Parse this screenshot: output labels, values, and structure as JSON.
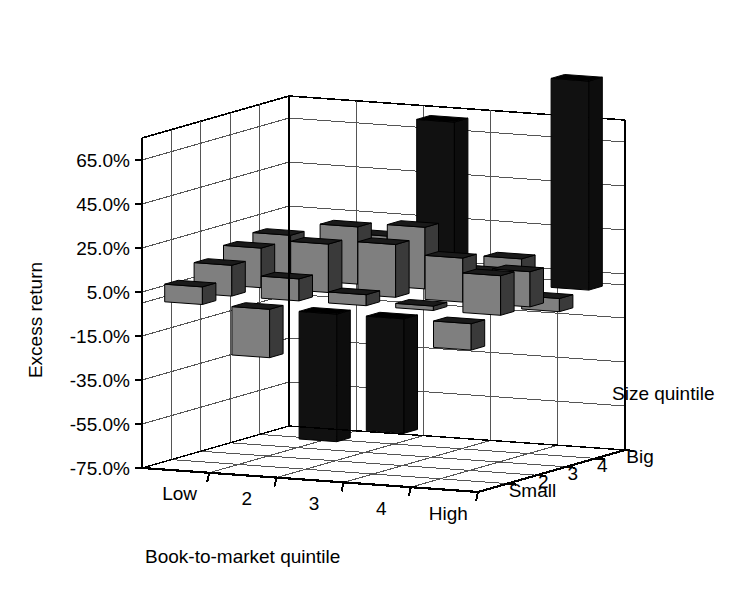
{
  "chart_data": {
    "type": "bar",
    "subtype": "3d-grouped-bar",
    "title": "",
    "xlabel": "Book-to-market quintile",
    "ylabel": "Excess return",
    "zlabel": "Size quintile",
    "categories": [
      "Low",
      "2",
      "3",
      "4",
      "High"
    ],
    "z_categories": [
      "Small",
      "2",
      "3",
      "4",
      "Big"
    ],
    "ylim": [
      -75,
      75
    ],
    "ytick_labels": [
      "65.0%",
      "45.0%",
      "25.0%",
      "5.0%",
      "-15.0%",
      "-35.0%",
      "-55.0%",
      "-75.0%"
    ],
    "ytick_values": [
      65,
      45,
      25,
      5,
      -15,
      -35,
      -55,
      -75
    ],
    "grid": true,
    "legend": "none",
    "units": "percent",
    "series": [
      {
        "name": "Small",
        "values": [
          8,
          -22,
          -58,
          -52,
          -12
        ]
      },
      {
        "name": "2",
        "values": [
          14,
          10,
          5,
          2,
          18
        ]
      },
      {
        "name": "3",
        "values": [
          18,
          22,
          24,
          20,
          16
        ]
      },
      {
        "name": "4",
        "values": [
          20,
          26,
          28,
          10,
          -6
        ]
      },
      {
        "name": "Big",
        "values": [
          10,
          18,
          72,
          12,
          95
        ]
      }
    ]
  },
  "axes": {
    "y_title": "Excess return",
    "x_title": "Book-to-market quintile",
    "z_title": "Size quintile",
    "y_ticks": [
      "65.0%",
      "45.0%",
      "25.0%",
      "5.0%",
      "-15.0%",
      "-35.0%",
      "-55.0%",
      "-75.0%"
    ],
    "x_ticks": [
      "Low",
      "2",
      "3",
      "4",
      "High"
    ],
    "z_ticks": [
      "Small",
      "2",
      "3",
      "4",
      "Big"
    ]
  },
  "style": {
    "bar_front": "#7f7f7f",
    "bar_side": "#3a3a3a",
    "bar_top": "#1a1a1a",
    "bar_dark": "#111111",
    "grid_color": "#555555",
    "axis_color": "#000000",
    "background": "#ffffff"
  }
}
